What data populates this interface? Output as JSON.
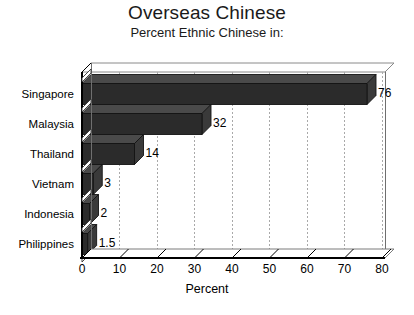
{
  "chart_data": {
    "type": "bar",
    "orientation": "horizontal",
    "title": "Overseas Chinese",
    "subtitle": "Percent Ethnic Chinese in:",
    "xlabel": "Percent",
    "ylabel": "",
    "xlim": [
      0,
      80
    ],
    "xticks": [
      0,
      10,
      20,
      30,
      40,
      50,
      60,
      70,
      80
    ],
    "xtick_labels": [
      "0",
      "10",
      "20",
      "30",
      "40",
      "50",
      "60",
      "70",
      "80"
    ],
    "grid": "vertical-dotted",
    "legend": "none",
    "bar_style": "3d-extruded",
    "bar_color": "#2b2b2b",
    "bar_top_color": "#4a4a4a",
    "bar_side_color": "#3a3a3a",
    "grid_color": "#a9a9a9",
    "axis_color": "#000000",
    "categories": [
      "Singapore",
      "Malaysia",
      "Thailand",
      "Vietnam",
      "Indonesia",
      "Philippines"
    ],
    "values": [
      76,
      32,
      14,
      3,
      2,
      1.5
    ],
    "value_labels": [
      "76",
      "32",
      "14",
      "3",
      "2",
      "1.5"
    ]
  }
}
